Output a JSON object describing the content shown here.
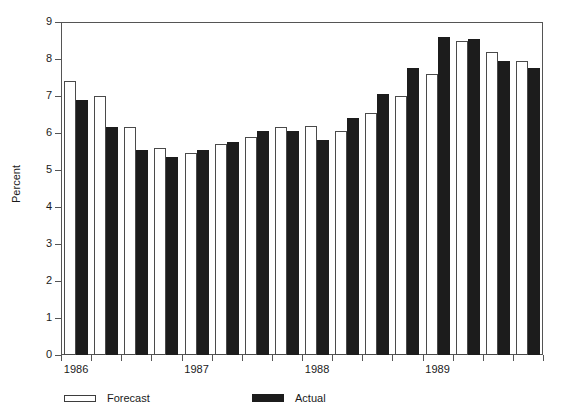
{
  "chart_data": {
    "type": "bar",
    "title": "",
    "subtitle": "",
    "xlabel": "",
    "ylabel": "Percent",
    "ylim": [
      0,
      9
    ],
    "ytick_labels": [
      "0",
      "1",
      "2",
      "3",
      "4",
      "5",
      "6",
      "7",
      "8",
      "9"
    ],
    "ytick_values": [
      0,
      1,
      2,
      3,
      4,
      5,
      6,
      7,
      8,
      9
    ],
    "xtick_labels": [
      "1986",
      "1987",
      "1988",
      "1989"
    ],
    "grid": false,
    "legend_position": "bottom-left",
    "categories": [
      "1986 Q1",
      "1986 Q2",
      "1986 Q3",
      "1986 Q4",
      "1987 Q1",
      "1987 Q2",
      "1987 Q3",
      "1987 Q4",
      "1988 Q1",
      "1988 Q2",
      "1988 Q3",
      "1988 Q4",
      "1989 Q1",
      "1989 Q2",
      "1989 Q3",
      "1989 Q4"
    ],
    "series": [
      {
        "name": "Forecast",
        "color": "#ffffff",
        "edge_color": "#4a4a4a",
        "values": [
          7.4,
          7.0,
          6.15,
          5.6,
          5.45,
          5.7,
          5.9,
          6.15,
          6.2,
          6.05,
          6.55,
          7.0,
          7.6,
          8.5,
          8.2,
          7.95
        ]
      },
      {
        "name": "Actual",
        "color": "#1c1c1c",
        "edge_color": "#1c1c1c",
        "values": [
          6.9,
          6.15,
          5.55,
          5.35,
          5.55,
          5.75,
          6.05,
          6.05,
          5.8,
          6.4,
          7.05,
          7.75,
          8.6,
          8.55,
          7.95,
          7.75
        ]
      }
    ]
  },
  "legend": {
    "entries": [
      {
        "label": "Forecast",
        "swatch": "hollow-bar-swatch"
      },
      {
        "label": "Actual",
        "swatch": "filled-bar-swatch"
      }
    ]
  }
}
